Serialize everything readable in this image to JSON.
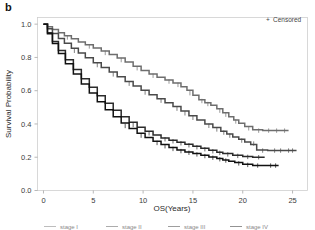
{
  "figure": {
    "panel_label": "b",
    "background_color": "#ffffff"
  },
  "legend": {
    "censored_label": "Censored",
    "censored_symbol": "+",
    "position": "top-right"
  },
  "bottom_legend": {
    "clipped": true,
    "items": [
      "stage I",
      "stage II",
      "stage III",
      "stage IV"
    ]
  },
  "chart_data": {
    "type": "line",
    "subtype": "kaplan-meier-survival",
    "title": "",
    "xlabel": "OS(Years)",
    "ylabel": "Survival Probability",
    "xlim": [
      -0.6,
      26.5
    ],
    "ylim": [
      0.0,
      1.04
    ],
    "xticks": [
      0,
      5,
      10,
      15,
      20,
      25
    ],
    "xtick_labels": [
      "0",
      "5",
      "10",
      "15",
      "20",
      "25"
    ],
    "yticks": [
      0.0,
      0.2,
      0.4,
      0.6,
      0.8,
      1.0
    ],
    "ytick_labels": [
      "0.0",
      "0.2",
      "0.4",
      "0.6",
      "0.8",
      "1.0"
    ],
    "grid": false,
    "legend_position": "top-right",
    "series": [
      {
        "name": "stage I",
        "color": "#6e6e6e",
        "plateau_value": 0.36,
        "final_x": 24.6,
        "x": [
          0,
          0.4,
          0.9,
          1.5,
          2.1,
          2.8,
          3.5,
          4.2,
          5.0,
          5.8,
          6.6,
          7.4,
          8.2,
          9.0,
          9.8,
          10.6,
          11.4,
          12.2,
          13.0,
          13.8,
          14.4,
          15.0,
          15.6,
          16.2,
          16.8,
          17.4,
          18.0,
          18.6,
          19.1,
          19.6,
          20.2,
          21.0,
          22.0,
          23.0,
          24.6
        ],
        "y": [
          1.0,
          0.985,
          0.968,
          0.949,
          0.931,
          0.912,
          0.893,
          0.876,
          0.857,
          0.838,
          0.818,
          0.796,
          0.772,
          0.747,
          0.722,
          0.7,
          0.681,
          0.664,
          0.646,
          0.624,
          0.602,
          0.572,
          0.545,
          0.528,
          0.512,
          0.492,
          0.468,
          0.444,
          0.424,
          0.405,
          0.385,
          0.365,
          0.36,
          0.36,
          0.36
        ],
        "censored_x": [
          2.4,
          4.6,
          6.2,
          7.8,
          9.4,
          11.0,
          12.6,
          13.5,
          14.7,
          15.9,
          16.5,
          17.7,
          18.3,
          19.3,
          20.6,
          21.6,
          22.6,
          23.4,
          24.2
        ],
        "censored_y": [
          0.92,
          0.866,
          0.827,
          0.784,
          0.735,
          0.69,
          0.655,
          0.635,
          0.585,
          0.538,
          0.52,
          0.48,
          0.456,
          0.415,
          0.374,
          0.36,
          0.36,
          0.36,
          0.36
        ]
      },
      {
        "name": "stage II",
        "color": "#4a4a4a",
        "plateau_value": 0.24,
        "final_x": 25.4,
        "x": [
          0,
          0.4,
          0.9,
          1.5,
          2.1,
          2.8,
          3.5,
          4.2,
          5.0,
          5.8,
          6.6,
          7.4,
          8.2,
          9.0,
          9.8,
          10.6,
          11.4,
          12.2,
          13.0,
          13.8,
          14.6,
          15.4,
          16.2,
          17.0,
          17.8,
          18.4,
          19.0,
          19.6,
          20.2,
          20.8,
          21.4,
          22.5,
          24.0,
          25.4
        ],
        "y": [
          1.0,
          0.972,
          0.944,
          0.914,
          0.885,
          0.855,
          0.826,
          0.798,
          0.768,
          0.74,
          0.712,
          0.684,
          0.656,
          0.628,
          0.602,
          0.576,
          0.552,
          0.528,
          0.505,
          0.478,
          0.45,
          0.424,
          0.4,
          0.378,
          0.356,
          0.34,
          0.322,
          0.308,
          0.292,
          0.276,
          0.244,
          0.24,
          0.24,
          0.24
        ],
        "censored_x": [
          3.1,
          5.4,
          7.0,
          8.6,
          10.2,
          11.8,
          13.4,
          14.2,
          15.0,
          16.6,
          17.4,
          18.1,
          18.7,
          19.9,
          21.1,
          22.0,
          23.2,
          23.8,
          24.6,
          25.0
        ],
        "censored_y": [
          0.84,
          0.754,
          0.698,
          0.642,
          0.589,
          0.54,
          0.492,
          0.464,
          0.437,
          0.389,
          0.367,
          0.348,
          0.33,
          0.3,
          0.282,
          0.24,
          0.24,
          0.24,
          0.24,
          0.24
        ]
      },
      {
        "name": "stage III",
        "color": "#2b2b2b",
        "plateau_value": 0.2,
        "final_x": 22.2,
        "x": [
          0,
          0.4,
          0.9,
          1.5,
          2.2,
          3.0,
          3.8,
          4.6,
          5.4,
          6.2,
          7.0,
          7.8,
          8.6,
          9.4,
          10.2,
          11.0,
          11.8,
          12.6,
          13.4,
          14.2,
          15.0,
          15.8,
          16.6,
          17.4,
          18.0,
          19.0,
          20.0,
          21.0,
          22.2
        ],
        "y": [
          1.0,
          0.948,
          0.896,
          0.842,
          0.786,
          0.728,
          0.672,
          0.62,
          0.57,
          0.524,
          0.482,
          0.444,
          0.41,
          0.38,
          0.356,
          0.334,
          0.316,
          0.302,
          0.29,
          0.278,
          0.266,
          0.254,
          0.242,
          0.23,
          0.222,
          0.212,
          0.204,
          0.2,
          0.2
        ],
        "censored_x": [
          9.0,
          10.6,
          12.2,
          13.0,
          13.8,
          14.6,
          15.4,
          16.2,
          17.0,
          17.7,
          18.5,
          19.5,
          20.5,
          21.6
        ],
        "censored_y": [
          0.394,
          0.344,
          0.308,
          0.296,
          0.284,
          0.272,
          0.26,
          0.248,
          0.236,
          0.226,
          0.217,
          0.208,
          0.202,
          0.2
        ]
      },
      {
        "name": "stage IV",
        "color": "#111111",
        "plateau_value": 0.15,
        "final_x": 23.6,
        "x": [
          0,
          0.4,
          0.9,
          1.5,
          2.2,
          3.0,
          3.8,
          4.6,
          5.4,
          6.2,
          7.0,
          7.8,
          8.6,
          9.4,
          10.2,
          11.0,
          11.8,
          12.6,
          13.4,
          14.2,
          15.0,
          15.8,
          16.6,
          17.4,
          18.0,
          18.6,
          19.2,
          20.0,
          21.0,
          22.2,
          23.6
        ],
        "y": [
          1.0,
          0.942,
          0.884,
          0.824,
          0.762,
          0.7,
          0.64,
          0.586,
          0.534,
          0.486,
          0.444,
          0.406,
          0.372,
          0.344,
          0.318,
          0.296,
          0.276,
          0.258,
          0.244,
          0.232,
          0.222,
          0.212,
          0.202,
          0.192,
          0.184,
          0.176,
          0.168,
          0.158,
          0.15,
          0.15,
          0.15
        ],
        "censored_x": [
          8.2,
          9.8,
          11.4,
          12.2,
          13.0,
          13.8,
          14.6,
          15.4,
          16.2,
          17.0,
          17.7,
          18.3,
          19.6,
          20.5,
          21.5,
          22.8,
          23.3
        ],
        "censored_y": [
          0.388,
          0.33,
          0.286,
          0.266,
          0.25,
          0.237,
          0.227,
          0.217,
          0.207,
          0.197,
          0.188,
          0.18,
          0.163,
          0.154,
          0.15,
          0.15,
          0.15
        ]
      }
    ]
  }
}
